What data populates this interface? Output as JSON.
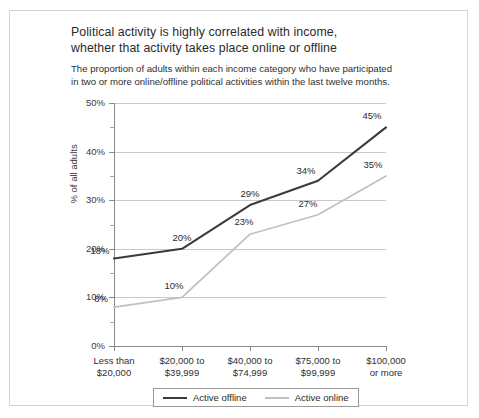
{
  "figure": {
    "title_lines": [
      "Political activity is highly correlated with income,",
      "whether that activity takes place online or offline"
    ],
    "subtitle_lines": [
      "The proportion of adults within each income category who have participated",
      "in two or more online/offline political activities within the last twelve months."
    ]
  },
  "chart_data": {
    "type": "line",
    "title": "Political activity is highly correlated with income, whether that activity takes place online or offline",
    "subtitle": "The proportion of adults within each income category who have participated in two or more online/offline political activities within the last twelve months.",
    "xlabel": "",
    "ylabel": "% of all adults",
    "categories": [
      [
        "Less than",
        "$20,000"
      ],
      [
        "$20,000 to",
        "$39,999"
      ],
      [
        "$40,000 to",
        "$74,999"
      ],
      [
        "$75,000 to",
        "$99,999"
      ],
      [
        "$100,000",
        "or more"
      ]
    ],
    "category_labels_flat": [
      "Less than $20,000",
      "$20,000 to $39,999",
      "$40,000 to $74,999",
      "$75,000 to $99,999",
      "$100,000 or more"
    ],
    "ylim": [
      0,
      50
    ],
    "ytick_values": [
      0,
      10,
      20,
      30,
      40,
      50
    ],
    "ytick_labels": [
      "0%",
      "10%",
      "20%",
      "30%",
      "40%",
      "50%"
    ],
    "yminor_values": [
      5,
      15,
      25,
      35,
      45
    ],
    "grid": "horizontal-major",
    "legend_position": "bottom",
    "series": [
      {
        "name": "Active offline",
        "color": "#3b3b3b",
        "values": [
          18,
          20,
          29,
          34,
          45
        ],
        "labels": [
          "18%",
          "20%",
          "29%",
          "34%",
          "45%"
        ]
      },
      {
        "name": "Active online",
        "color": "#c0c0c0",
        "values": [
          8,
          10,
          23,
          27,
          35
        ],
        "labels": [
          "8%",
          "10%",
          "23%",
          "27%",
          "35%"
        ]
      }
    ]
  }
}
